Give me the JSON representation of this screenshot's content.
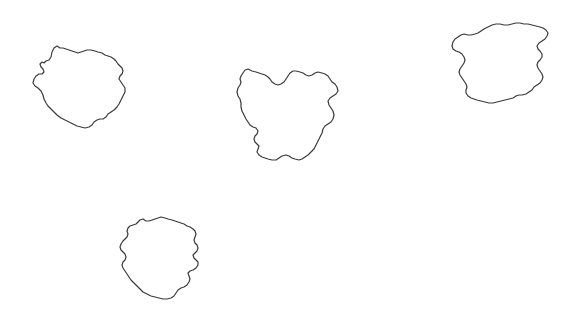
{
  "canvas": {
    "width": 566,
    "height": 320,
    "background_color": "#ffffff",
    "title": "Irregular Blob Contours"
  },
  "style": {
    "stroke_color": "#3a3a3a",
    "stroke_width": 1.2,
    "fill": "none"
  },
  "shapes": [
    {
      "id": "blob-1",
      "label": "top-left blob",
      "bbox": {
        "x": 33,
        "y": 45,
        "width": 92,
        "height": 83
      },
      "center": {
        "x": 79,
        "y": 86
      },
      "path": "M 60,48 L 57,46 L 54,48 L 52,52 L 51,57 L 49,60 L 46,61 L 44,63 L 42,62 L 40,64 L 41,67 L 43,69 L 44,72 L 42,74 L 39,74 L 36,76 L 34,79 L 33,83 L 35,86 L 38,88 L 41,91 L 43,95 L 44,99 L 46,103 L 48,106 L 51,109 L 54,112 L 57,115 L 61,118 L 65,120 L 69,122 L 73,124 L 77,126 L 81,127 L 85,128 L 89,127 L 92,125 L 94,122 L 97,120 L 100,119 L 103,119 L 106,117 L 108,114 L 111,112 L 114,110 L 117,107 L 119,104 L 121,100 L 123,96 L 125,92 L 125,88 L 123,85 L 121,82 L 119,79 L 120,76 L 122,74 L 123,71 L 122,68 L 120,66 L 118,64 L 116,61 L 114,59 L 111,57 L 108,56 L 105,55 L 102,53 L 98,52 L 95,51 L 91,50 L 87,50 L 84,51 L 81,52 L 78,53 L 75,52 L 72,51 L 69,50 L 66,49 L 63,48 Z"
    },
    {
      "id": "blob-2",
      "label": "middle blob",
      "bbox": {
        "x": 237,
        "y": 66,
        "width": 101,
        "height": 99
      },
      "center": {
        "x": 287,
        "y": 115
      },
      "path": "M 252,71 L 248,69 L 245,70 L 243,73 L 241,76 L 240,79 L 241,82 L 240,85 L 238,88 L 237,92 L 238,96 L 240,99 L 241,103 L 241,107 L 242,111 L 244,115 L 246,119 L 248,122 L 250,125 L 253,127 L 256,128 L 258,131 L 257,134 L 255,136 L 254,139 L 255,142 L 257,144 L 259,146 L 258,149 L 257,152 L 259,155 L 262,157 L 265,158 L 268,159 L 272,160 L 276,160 L 279,158 L 282,156 L 286,155 L 289,156 L 292,158 L 295,159 L 299,160 L 302,159 L 305,157 L 308,155 L 311,152 L 314,149 L 316,145 L 318,141 L 320,137 L 322,133 L 323,129 L 325,126 L 328,124 L 331,122 L 333,119 L 334,115 L 333,111 L 331,108 L 329,105 L 328,101 L 330,98 L 333,96 L 336,94 L 338,91 L 337,87 L 335,84 L 332,82 L 330,79 L 328,76 L 325,74 L 322,73 L 318,72 L 315,73 L 312,75 L 309,76 L 306,75 L 303,73 L 300,72 L 296,71 L 293,71 L 290,73 L 288,76 L 286,79 L 284,82 L 281,84 L 278,85 L 275,84 L 272,82 L 270,79 L 268,77 L 265,75 L 262,74 L 259,73 L 256,72 Z"
    },
    {
      "id": "blob-3",
      "label": "top-right blob",
      "bbox": {
        "x": 452,
        "y": 23,
        "width": 96,
        "height": 80
      },
      "center": {
        "x": 500,
        "y": 63
      },
      "path": "M 468,35 L 464,34 L 461,35 L 458,37 L 455,39 L 453,42 L 452,46 L 453,49 L 456,51 L 459,52 L 462,54 L 464,57 L 465,60 L 464,63 L 462,66 L 460,69 L 459,72 L 460,75 L 462,78 L 464,81 L 466,84 L 467,87 L 466,90 L 466,93 L 468,96 L 471,98 L 474,99 L 477,100 L 481,101 L 485,102 L 489,103 L 493,103 L 497,102 L 501,101 L 505,100 L 509,99 L 513,98 L 516,96 L 519,95 L 522,95 L 526,94 L 529,92 L 532,90 L 534,87 L 537,85 L 540,83 L 542,80 L 543,77 L 542,74 L 540,71 L 538,68 L 537,65 L 538,62 L 540,60 L 542,57 L 542,54 L 540,51 L 538,49 L 537,46 L 539,43 L 542,41 L 545,39 L 547,36 L 548,33 L 546,30 L 543,28 L 540,27 L 536,26 L 532,25 L 528,24 L 524,24 L 520,23 L 516,23 L 512,24 L 508,25 L 504,25 L 500,24 L 496,24 L 492,25 L 488,27 L 484,29 L 481,31 L 478,33 L 475,34 L 471,35 Z"
    },
    {
      "id": "blob-4",
      "label": "bottom-left blob",
      "bbox": {
        "x": 120,
        "y": 217,
        "width": 80,
        "height": 83
      },
      "center": {
        "x": 160,
        "y": 258
      },
      "path": "M 146,221 L 143,219 L 140,220 L 138,222 L 136,224 L 133,225 L 130,226 L 128,228 L 127,231 L 128,234 L 127,237 L 125,239 L 123,241 L 121,244 L 120,247 L 121,250 L 123,252 L 125,254 L 126,257 L 125,260 L 123,262 L 122,265 L 123,268 L 125,271 L 127,274 L 129,277 L 131,280 L 134,283 L 137,286 L 140,289 L 143,292 L 147,294 L 151,296 L 155,297 L 159,298 L 163,299 L 167,299 L 171,298 L 174,296 L 176,293 L 178,290 L 181,288 L 184,287 L 187,285 L 189,282 L 190,279 L 189,276 L 188,273 L 190,271 L 193,270 L 196,268 L 198,265 L 198,262 L 196,260 L 194,258 L 193,255 L 195,253 L 197,251 L 198,248 L 197,245 L 195,243 L 194,240 L 195,237 L 196,234 L 195,231 L 193,229 L 190,227 L 187,226 L 184,224 L 181,223 L 178,222 L 175,221 L 172,220 L 168,219 L 165,218 L 161,217 L 158,218 L 155,219 L 152,220 L 149,221 Z"
    }
  ]
}
